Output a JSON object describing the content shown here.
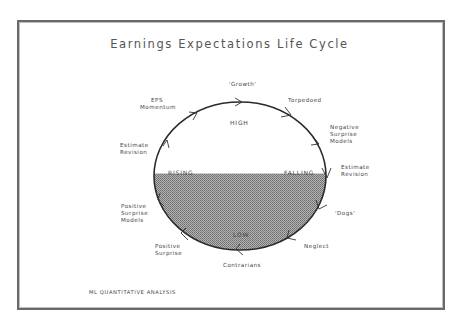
{
  "diagram": {
    "title": "Earnings Expectations Life Cycle",
    "zones": {
      "high": "HIGH",
      "low": "LOW",
      "rising": "RISING",
      "falling": "FALLING"
    },
    "stages": [
      {
        "id": "growth",
        "label": "'Growth'"
      },
      {
        "id": "torpedoed",
        "label": "Torpedoed"
      },
      {
        "id": "negative-surprise-models",
        "lines": [
          "Negative",
          "Surprise",
          "Models"
        ]
      },
      {
        "id": "estimate-revision-right",
        "lines": [
          "Estimate",
          "Revision"
        ]
      },
      {
        "id": "dogs",
        "label": "'Dogs'"
      },
      {
        "id": "neglect",
        "label": "Neglect"
      },
      {
        "id": "contrarians",
        "label": "Contrarians"
      },
      {
        "id": "positive-surprise",
        "lines": [
          "Positive",
          "Surprise"
        ]
      },
      {
        "id": "positive-surprise-models",
        "lines": [
          "Positive",
          "Surprise",
          "Models"
        ]
      },
      {
        "id": "estimate-revision-left",
        "lines": [
          "Estimate",
          "Revision"
        ]
      },
      {
        "id": "eps-momentum",
        "lines": [
          "EPS",
          "Momentum"
        ]
      }
    ],
    "flow_direction": "clockwise",
    "colors": {
      "frame": "#6a6a6a",
      "ellipse_stroke": "#2a2a2a",
      "shaded_fill": "#9a9a9a"
    }
  },
  "footer": {
    "source": "ML QUANTITATIVE ANALYSIS"
  }
}
